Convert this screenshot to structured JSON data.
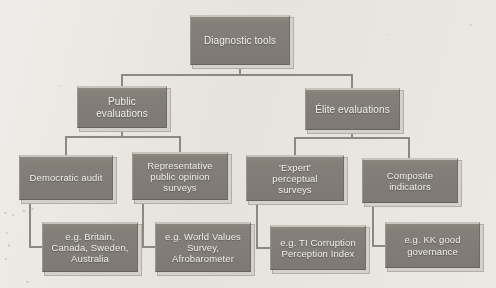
{
  "diagram": {
    "title": "Diagnostic tools",
    "type": "hierarchy-tree",
    "root": {
      "id": "diagnostic-tools",
      "label": "Diagnostic tools",
      "level": 1
    },
    "branches": [
      {
        "id": "public-evaluations",
        "label": "Public evaluations",
        "level": 2,
        "children": [
          {
            "id": "democratic-audit",
            "label": "Democratic audit",
            "level": 3,
            "example": {
              "id": "example-democratic-audit",
              "label": "e.g. Britain, Canada, Sweden, Australia",
              "level": 4
            }
          },
          {
            "id": "representative-public-opinion-surveys",
            "label": "Representative public opinion surveys",
            "level": 3,
            "example": {
              "id": "example-public-opinion-surveys",
              "label": "e.g. World Values Survey, Afrobarometer",
              "level": 4
            }
          }
        ]
      },
      {
        "id": "elite-evaluations",
        "label": "Élite evaluations",
        "level": 2,
        "children": [
          {
            "id": "expert-perceptual-surveys",
            "label": "'Expert' perceptual surveys",
            "level": 3,
            "example": {
              "id": "example-ti-corruption-index",
              "label": "e.g. TI Corruption Perception Index",
              "level": 4
            }
          },
          {
            "id": "composite-indicators",
            "label": "Composite indicators",
            "level": 3,
            "example": {
              "id": "example-kk-good-governance",
              "label": "e.g. KK good governance",
              "level": 4
            }
          }
        ]
      }
    ]
  },
  "labels": {
    "root": "Diagnostic tools",
    "public_evaluations": "Public evaluations",
    "elite_evaluations": "Élite evaluations",
    "democratic_audit": "Democratic audit",
    "representative_surveys": "Representative public opinion surveys",
    "expert_surveys": "'Expert' perceptual surveys",
    "composite_indicators": "Composite indicators",
    "example_britain": "e.g. Britain, Canada, Sweden, Australia",
    "example_world_values": "e.g. World Values Survey, Afrobarometer",
    "example_ti": "e.g. TI Corruption Perception Index",
    "example_kk": "e.g. KK good governance"
  },
  "lines": {
    "root_label_l1": "Diagnostic tools",
    "public_l1": "Public",
    "public_l2": "evaluations",
    "elite_l1": "Élite evaluations",
    "democratic_l1": "Democratic audit",
    "rep_l1": "Representative",
    "rep_l2": "public opinion",
    "rep_l3": "surveys",
    "expert_l1": "'Expert'",
    "expert_l2": "perceptual",
    "expert_l3": "surveys",
    "composite_l1": "Composite",
    "composite_l2": "indicators",
    "ex_brit_l1": "e.g. Britain,",
    "ex_brit_l2": "Canada, Sweden,",
    "ex_brit_l3": "Australia",
    "ex_wvs_l1": "e.g. World Values",
    "ex_wvs_l2": "Survey,",
    "ex_wvs_l3": "Afrobarometer",
    "ex_ti_l1": "e.g. TI Corruption",
    "ex_ti_l2": "Perception Index",
    "ex_kk_l1": "e.g. KK good",
    "ex_kk_l2": "governance"
  },
  "colors": {
    "box_fill": "#7e7a73",
    "box_text": "#f4f3f1",
    "line": "#8d8880",
    "background": "#edeae6",
    "shadow": "#d7d3ce"
  }
}
